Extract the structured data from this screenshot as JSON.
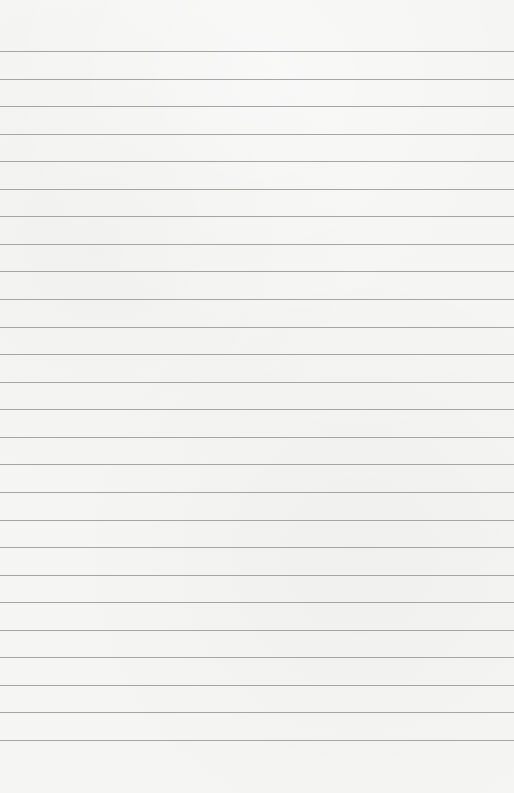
{
  "page": {
    "type": "blank lined paper",
    "line_count": 26,
    "colors": {
      "paper": "#f5f5f4",
      "rule": "#9c9c9c"
    }
  }
}
